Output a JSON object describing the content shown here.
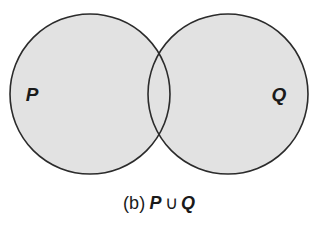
{
  "figure": {
    "kind": "venn-diagram",
    "background_color": "#ffffff",
    "fill_color": "#e2e2e2",
    "stroke_color": "#2b2b2b",
    "label_color": "#1a1a1a",
    "shaded_region": "union",
    "left_set": {
      "label": "P",
      "cx": 90,
      "cy": 94,
      "r": 80
    },
    "right_set": {
      "label": "Q",
      "cx": 228,
      "cy": 94,
      "r": 80
    },
    "label_positions": {
      "left_label_x": 32,
      "left_label_y": 101,
      "right_label_x": 279,
      "right_label_y": 101
    }
  },
  "caption": {
    "index": "(b)",
    "left_operand": "P",
    "operator": "∪",
    "right_operand": "Q",
    "full_text": "(b) P ∪ Q"
  }
}
